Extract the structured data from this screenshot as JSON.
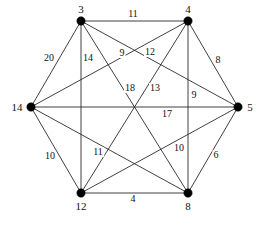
{
  "figure": {
    "width": 265,
    "height": 226,
    "background_color": "#ffffff",
    "edge_color": "#2b2b2b",
    "vertex_color": "#000000",
    "label_color": "#111111"
  },
  "chart_data": {
    "type": "diagram",
    "subtype": "weighted-undirected-graph",
    "layout": "hexagonal",
    "grid": false,
    "legend": "none",
    "vertex_count": 6,
    "edge_count": 15,
    "nodes": [
      {
        "id": "n3",
        "label": "3",
        "x": 81,
        "y": 21,
        "label_x": 81,
        "label_y": 9,
        "label_pos": "above"
      },
      {
        "id": "n4",
        "label": "4",
        "x": 188,
        "y": 21,
        "label_x": 188,
        "label_y": 9,
        "label_pos": "above"
      },
      {
        "id": "n5",
        "label": "5",
        "x": 238,
        "y": 107,
        "label_x": 250,
        "label_y": 107,
        "label_pos": "right"
      },
      {
        "id": "n8",
        "label": "8",
        "x": 188,
        "y": 193,
        "label_x": 188,
        "label_y": 206,
        "label_pos": "below"
      },
      {
        "id": "n12",
        "label": "12",
        "x": 81,
        "y": 193,
        "label_x": 81,
        "label_y": 206,
        "label_pos": "below"
      },
      {
        "id": "n14",
        "label": "14",
        "x": 31,
        "y": 107,
        "label_x": 17,
        "label_y": 107,
        "label_pos": "left"
      }
    ],
    "edges": [
      {
        "from": "n3",
        "to": "n4",
        "weight": "11",
        "label_x": 133,
        "label_y": 14
      },
      {
        "from": "n3",
        "to": "n14",
        "weight": "20",
        "label_x": 49,
        "label_y": 58
      },
      {
        "from": "n3",
        "to": "n12",
        "weight": "14",
        "label_x": 88,
        "label_y": 58
      },
      {
        "from": "n3",
        "to": "n8",
        "weight": "9",
        "label_x": 122,
        "label_y": 53
      },
      {
        "from": "n3",
        "to": "n5",
        "weight": "12",
        "label_x": 150,
        "label_y": 52
      },
      {
        "from": "n4",
        "to": "n5",
        "weight": "8",
        "label_x": 218,
        "label_y": 60
      },
      {
        "from": "n4",
        "to": "n14",
        "weight": "18",
        "label_x": 130,
        "label_y": 88
      },
      {
        "from": "n4",
        "to": "n12",
        "weight": "13",
        "label_x": 155,
        "label_y": 88
      },
      {
        "from": "n4",
        "to": "n8",
        "weight": "9",
        "label_x": 194,
        "label_y": 95
      },
      {
        "from": "n5",
        "to": "n14",
        "weight": "17",
        "label_x": 167,
        "label_y": 114
      },
      {
        "from": "n5",
        "to": "n12",
        "weight": "10",
        "label_x": 179,
        "label_y": 148
      },
      {
        "from": "n5",
        "to": "n8",
        "weight": "6",
        "label_x": 216,
        "label_y": 155
      },
      {
        "from": "n14",
        "to": "n12",
        "weight": "10",
        "label_x": 50,
        "label_y": 156
      },
      {
        "from": "n14",
        "to": "n8",
        "weight": "11",
        "label_x": 98,
        "label_y": 152
      },
      {
        "from": "n12",
        "to": "n8",
        "weight": "4",
        "label_x": 133,
        "label_y": 199
      }
    ]
  }
}
